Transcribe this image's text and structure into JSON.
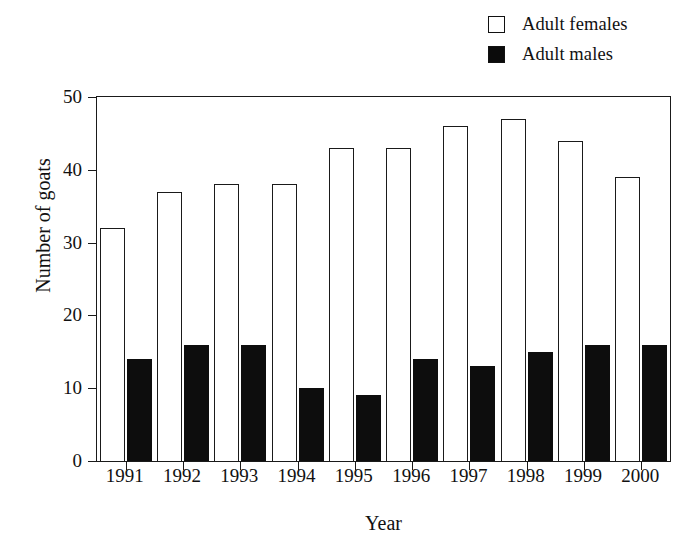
{
  "chart_data": {
    "type": "bar",
    "title": "",
    "subtitle": "",
    "xlabel": "Year",
    "ylabel": "Number of goats",
    "categories": [
      "1991",
      "1992",
      "1993",
      "1994",
      "1995",
      "1996",
      "1997",
      "1998",
      "1999",
      "2000"
    ],
    "series": [
      {
        "name": "Adult females",
        "fill": "#ffffff",
        "edge": "#1a1a1a",
        "values": [
          32,
          37,
          38,
          38,
          43,
          43,
          46,
          47,
          44,
          39
        ]
      },
      {
        "name": "Adult males",
        "fill": "#0d0d0d",
        "edge": "#0d0d0d",
        "values": [
          14,
          16,
          16,
          10,
          9,
          14,
          13,
          15,
          16,
          16
        ]
      }
    ],
    "ylim": [
      0,
      50
    ],
    "yticks": [
      0,
      10,
      20,
      30,
      40,
      50
    ],
    "ytick_labels": [
      "0",
      "10",
      "20",
      "30",
      "40",
      "50"
    ],
    "grid": false,
    "legend_position": "top-right"
  },
  "legend": {
    "items": [
      {
        "label": "Adult females",
        "swatch": "empty"
      },
      {
        "label": "Adult males",
        "swatch": "filled"
      }
    ]
  },
  "axes": {
    "y_title": "Number of goats",
    "x_title": "Year"
  }
}
